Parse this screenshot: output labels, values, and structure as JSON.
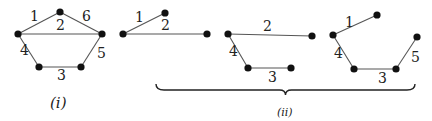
{
  "graphs": [
    {
      "id": "g1",
      "nodes": {
        "a": [
          18,
          34
        ],
        "b": [
          60,
          12
        ],
        "c": [
          102,
          34
        ],
        "d": [
          39,
          67
        ],
        "e": [
          81,
          67
        ]
      },
      "edges": [
        {
          "from": "a",
          "to": "b",
          "label": "1",
          "lx": 30,
          "ly": 21
        },
        {
          "from": "a",
          "to": "c",
          "label": "2",
          "lx": 56,
          "ly": 30
        },
        {
          "from": "d",
          "to": "e",
          "label": "3",
          "lx": 57,
          "ly": 80
        },
        {
          "from": "a",
          "to": "d",
          "label": "4",
          "lx": 20,
          "ly": 55
        },
        {
          "from": "c",
          "to": "e",
          "label": "5",
          "lx": 97,
          "ly": 58
        },
        {
          "from": "b",
          "to": "c",
          "label": "6",
          "lx": 82,
          "ly": 21
        }
      ]
    },
    {
      "id": "g2",
      "nodes": {
        "a": [
          123,
          34
        ],
        "b": [
          165,
          13
        ],
        "c": [
          207,
          34
        ]
      },
      "edges": [
        {
          "from": "a",
          "to": "b",
          "label": "1",
          "lx": 135,
          "ly": 22
        },
        {
          "from": "a",
          "to": "c",
          "label": "2",
          "lx": 161,
          "ly": 30
        }
      ]
    },
    {
      "id": "g3",
      "nodes": {
        "a": [
          228,
          34
        ],
        "c": [
          312,
          36
        ],
        "d": [
          248,
          68
        ],
        "e": [
          291,
          68
        ]
      },
      "edges": [
        {
          "from": "a",
          "to": "c",
          "label": "2",
          "lx": 263,
          "ly": 31
        },
        {
          "from": "a",
          "to": "d",
          "label": "4",
          "lx": 229,
          "ly": 56
        },
        {
          "from": "d",
          "to": "e",
          "label": "3",
          "lx": 268,
          "ly": 82
        }
      ]
    },
    {
      "id": "g4",
      "nodes": {
        "a": [
          333,
          35
        ],
        "b": [
          377,
          15
        ],
        "d": [
          354,
          69
        ],
        "e": [
          396,
          69
        ],
        "f": [
          417,
          37
        ]
      },
      "edges": [
        {
          "from": "a",
          "to": "b",
          "label": "1",
          "lx": 345,
          "ly": 27
        },
        {
          "from": "a",
          "to": "d",
          "label": "4",
          "lx": 334,
          "ly": 58
        },
        {
          "from": "d",
          "to": "e",
          "label": "3",
          "lx": 378,
          "ly": 83
        },
        {
          "from": "e",
          "to": "f",
          "label": "5",
          "lx": 411,
          "ly": 62
        }
      ]
    }
  ],
  "captions": {
    "i": "(i)",
    "ii": "(ii)"
  },
  "brace": {
    "x1": 156,
    "x2": 415,
    "y": 90
  }
}
